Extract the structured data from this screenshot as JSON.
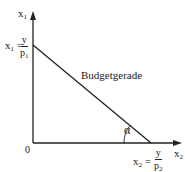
{
  "diagram": {
    "y_axis": {
      "label": "x",
      "subscript": "1"
    },
    "x_axis": {
      "label": "x",
      "subscript": "2"
    },
    "origin_label": "0",
    "y_intercept": {
      "lhs": "x",
      "lhs_sub": "1",
      "eq": "=",
      "numerator": "y",
      "denominator": "p",
      "denominator_sub": "1"
    },
    "x_intercept": {
      "lhs": "x",
      "lhs_sub": "2",
      "eq": "=",
      "numerator": "y",
      "denominator": "p",
      "denominator_sub": "2"
    },
    "line_label": "Budgetgerade",
    "angle_label": "α",
    "colors": {
      "stroke": "#222222",
      "background": "#ffffff"
    }
  }
}
